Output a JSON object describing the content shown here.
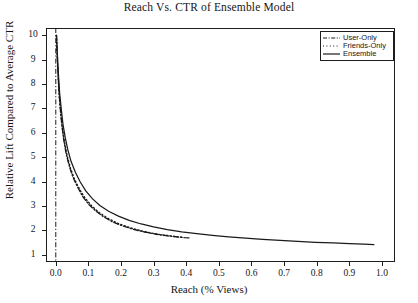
{
  "chart_data": {
    "type": "line",
    "title": "Reach Vs. CTR of Ensemble Model",
    "xlabel": "Reach (% Views)",
    "ylabel": "Relative Lift Compared to Average CTR",
    "xlim": [
      -0.03,
      1.04
    ],
    "ylim": [
      0.7,
      10.3
    ],
    "grid": false,
    "legend_position": "top-right",
    "xticks": [
      "0.0",
      "0.1",
      "0.2",
      "0.3",
      "0.4",
      "0.5",
      "0.6",
      "0.7",
      "0.8",
      "0.9",
      "1.0"
    ],
    "xtick_values": [
      0.0,
      0.1,
      0.2,
      0.3,
      0.4,
      0.5,
      0.6,
      0.7,
      0.8,
      0.9,
      1.0
    ],
    "yticks": [
      "1",
      "2",
      "3",
      "4",
      "5",
      "6",
      "7",
      "8",
      "9",
      "10"
    ],
    "ytick_values": [
      1,
      2,
      3,
      4,
      5,
      6,
      7,
      8,
      9,
      10
    ],
    "series": [
      {
        "name": "User-Only",
        "style": "dashdot",
        "color": "#1a1a1a",
        "x": [
          0.002,
          0.004,
          0.006,
          0.009,
          0.013,
          0.018,
          0.024,
          0.031,
          0.04,
          0.052,
          0.066,
          0.082,
          0.1,
          0.122,
          0.147,
          0.175,
          0.205,
          0.238,
          0.272,
          0.308,
          0.344,
          0.372,
          0.395,
          0.408
        ],
        "y": [
          10.0,
          9.4,
          8.7,
          7.9,
          7.1,
          6.4,
          5.75,
          5.2,
          4.7,
          4.2,
          3.8,
          3.4,
          3.08,
          2.8,
          2.55,
          2.34,
          2.18,
          2.04,
          1.93,
          1.84,
          1.77,
          1.73,
          1.7,
          1.69
        ]
      },
      {
        "name": "Friends-Only",
        "style": "dotted",
        "color": "#1a1a1a",
        "x": [
          0.002,
          0.004,
          0.007,
          0.01,
          0.015,
          0.02,
          0.027,
          0.035,
          0.045,
          0.058,
          0.073,
          0.09,
          0.11,
          0.133,
          0.159,
          0.188,
          0.22,
          0.253,
          0.288,
          0.323,
          0.352,
          0.374,
          0.39
        ],
        "y": [
          10.0,
          9.2,
          8.4,
          7.6,
          6.85,
          6.2,
          5.6,
          5.05,
          4.55,
          4.08,
          3.68,
          3.32,
          3.0,
          2.73,
          2.5,
          2.3,
          2.14,
          2.01,
          1.9,
          1.82,
          1.77,
          1.73,
          1.71
        ]
      },
      {
        "name": "Ensemble",
        "style": "solid",
        "color": "#1a1a1a",
        "x": [
          0.002,
          0.004,
          0.006,
          0.009,
          0.012,
          0.017,
          0.022,
          0.029,
          0.037,
          0.047,
          0.06,
          0.075,
          0.092,
          0.112,
          0.135,
          0.162,
          0.192,
          0.225,
          0.262,
          0.3,
          0.342,
          0.386,
          0.432,
          0.48,
          0.53,
          0.582,
          0.634,
          0.688,
          0.742,
          0.796,
          0.85,
          0.9,
          0.945,
          0.975
        ],
        "y": [
          10.0,
          9.5,
          8.9,
          8.2,
          7.6,
          6.95,
          6.35,
          5.8,
          5.3,
          4.82,
          4.38,
          3.98,
          3.62,
          3.3,
          3.02,
          2.78,
          2.58,
          2.41,
          2.26,
          2.14,
          2.03,
          1.94,
          1.86,
          1.79,
          1.73,
          1.68,
          1.63,
          1.59,
          1.55,
          1.51,
          1.48,
          1.45,
          1.43,
          1.41
        ]
      }
    ],
    "vertical_reference_line": {
      "name": "zero-reach-line",
      "x": 0.0,
      "style": "dashdot"
    }
  },
  "legend": {
    "items": [
      {
        "label": "User-Only",
        "style": "dashdot"
      },
      {
        "label": "Friends-Only",
        "style": "dotted"
      },
      {
        "label": "Ensemble",
        "style": "solid"
      }
    ]
  }
}
